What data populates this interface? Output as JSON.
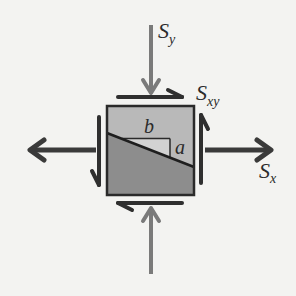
{
  "diagram": {
    "colors": {
      "background": "#f3f3f1",
      "element_upper": "#b9b9b9",
      "element_lower": "#8d8d8d",
      "triangle_fill": "#d2d2d2",
      "outline": "#2a2a2a",
      "normal_arrow_y": "#7a7a7a",
      "normal_arrow_x": "#3a3a3a",
      "shear_arrow": "#2f2f2f"
    },
    "labels": {
      "sy": {
        "base": "S",
        "sub": "y"
      },
      "sxy": {
        "base": "S",
        "sub": "xy"
      },
      "sx": {
        "base": "S",
        "sub": "x"
      },
      "b": "b",
      "a": "a"
    }
  }
}
